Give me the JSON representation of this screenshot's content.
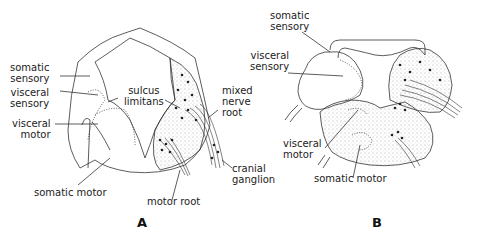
{
  "panels": [
    {
      "id": "A",
      "label": "A",
      "annotations": {
        "somatic_sensory": [
          "somatic",
          "sensory"
        ],
        "visceral_sensory": [
          "visceral",
          "sensory"
        ],
        "visceral_motor": [
          "visceral",
          "motor"
        ],
        "sulcus_limitans": [
          "sulcus",
          "limitans"
        ],
        "mixed_nerve_root": [
          "mixed",
          "nerve",
          "root"
        ],
        "cranial_ganglion": [
          "cranial",
          "ganglion"
        ],
        "somatic_motor": "somatic motor",
        "motor_root": "motor root"
      }
    },
    {
      "id": "B",
      "label": "B",
      "annotations": {
        "somatic_sensory": [
          "somatic",
          "sensory"
        ],
        "visceral_sensory": [
          "visceral",
          "sensory"
        ],
        "visceral_motor": [
          "visceral",
          "motor"
        ],
        "somatic_motor": "somatic motor"
      }
    }
  ],
  "colors": {
    "line": "#333333",
    "text": "#222222",
    "stipple": "#555555"
  }
}
